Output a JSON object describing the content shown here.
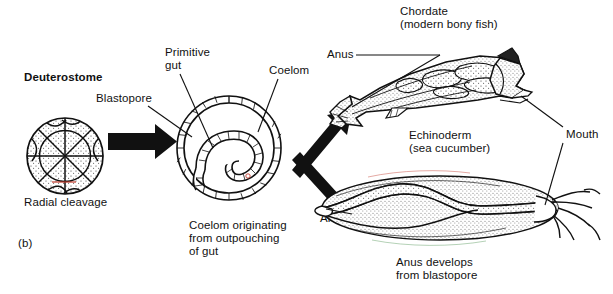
{
  "figure": {
    "panel_label": "(b)",
    "topic": "deuterostome-development",
    "background_color": "#ffffff",
    "ink_color": "#111111",
    "accent_color": "#c0392b"
  },
  "stages": {
    "embryo": {
      "title": "Deuterostome",
      "caption": "Radial cleavage",
      "icon": "radial-cleavage-embryo"
    },
    "gastrula": {
      "caption_line1": "Coelom originating",
      "caption_line2": "from outpouching",
      "caption_line3": "of gut",
      "caption": "Coelom originating\nfrom outpouching\nof gut",
      "icon": "gastrula-cross-section"
    }
  },
  "callouts": {
    "blastopore": "Blastopore",
    "primitive_gut_line1": "Primitive",
    "primitive_gut_line2": "gut",
    "primitive_gut": "Primitive\ngut",
    "coelom": "Coelom",
    "anus_chordate": "Anus",
    "anus_echinoderm": "Anus",
    "mouth": "Mouth"
  },
  "organisms": {
    "chordate": {
      "name": "Chordate",
      "subtitle": "(modern bony fish)",
      "icon": "bony-fish-illustration"
    },
    "echinoderm": {
      "name": "Echinoderm",
      "subtitle": "(sea cucumber)",
      "caption_line1": "Anus develops",
      "caption_line2": "from blastopore",
      "caption": "Anus develops\nfrom blastopore",
      "icon": "sea-cucumber-illustration"
    }
  },
  "arrows": {
    "cleavage_to_gastrula": "arrow-right",
    "gastrula_to_chordate": "arrow-up-right",
    "gastrula_to_echinoderm": "arrow-down-right"
  }
}
